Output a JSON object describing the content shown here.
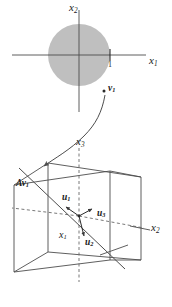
{
  "figure": {
    "colors": {
      "stroke": "#4d4d4d",
      "stroke_dark": "#2b2b2b",
      "disk_fill": "#bfbfbf",
      "text": "#1a1a1a",
      "background": "#ffffff"
    },
    "top_panel": {
      "name": "domain-plane",
      "axes": [
        {
          "id": "x1",
          "label": "x",
          "sub": "1",
          "orientation": "horizontal",
          "label_x": 150,
          "label_y": 60
        },
        {
          "id": "x2",
          "label": "x",
          "sub": "2",
          "orientation": "vertical",
          "label_x": 71,
          "label_y": 4
        }
      ],
      "disk": {
        "name": "unit-disk",
        "cx": 79,
        "cy": 55,
        "r": 31,
        "fill": "#bfbfbf"
      },
      "ticks": [
        {
          "id": "tick-1",
          "axis": "x1",
          "label": "1",
          "x": 110,
          "y": 66
        }
      ],
      "points": [
        {
          "id": "v1",
          "label": "v",
          "sub": "1",
          "dot_x": 104,
          "dot_y": 91,
          "label_x": 108,
          "label_y": 86
        }
      ]
    },
    "arrow": {
      "name": "mapping-arrow",
      "description": "curved arrow from v1 in the plane down-left into the cube"
    },
    "bottom_panel": {
      "name": "codomain-cube",
      "axes": [
        {
          "id": "x3",
          "label": "x",
          "sub": "3",
          "orientation": "vertical",
          "label_x": 77,
          "label_y": 138
        },
        {
          "id": "x2b",
          "label": "x",
          "sub": "2",
          "orientation": "depth-right",
          "label_x": 150,
          "label_y": 224
        },
        {
          "id": "x1b",
          "label": "x",
          "sub": "1",
          "orientation": "depth-left",
          "label_x": 60,
          "label_y": 231
        }
      ],
      "vectors": [
        {
          "id": "u1",
          "label": "u",
          "sub": "1",
          "label_x": 63,
          "label_y": 196,
          "dot_x": 65,
          "dot_y": 212
        },
        {
          "id": "u2",
          "label": "u",
          "sub": "2",
          "label_x": 86,
          "label_y": 241,
          "dot_x": 84,
          "dot_y": 240
        },
        {
          "id": "u3",
          "label": "u",
          "sub": "3",
          "label_x": 98,
          "label_y": 212,
          "dot_x": 93,
          "dot_y": 214
        },
        {
          "id": "Av1",
          "label": "Av",
          "sub": "1",
          "label_x": 17,
          "label_y": 182
        }
      ]
    }
  }
}
